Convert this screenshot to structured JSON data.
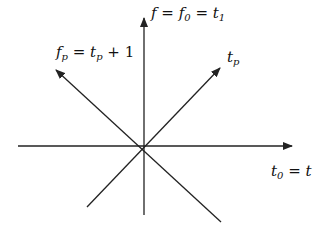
{
  "diagram": {
    "stroke_color": "#222222",
    "background": "#ffffff",
    "axes": [
      {
        "name": "horizontal-axis",
        "from": [
          18,
          146
        ],
        "to": [
          292,
          146
        ],
        "arrow": "end"
      },
      {
        "name": "vertical-axis",
        "from": [
          144,
          215
        ],
        "to": [
          144,
          18
        ],
        "arrow": "end"
      },
      {
        "name": "diagonal-tp",
        "from": [
          87,
          207
        ],
        "to": [
          220,
          68
        ],
        "arrow": "end"
      },
      {
        "name": "diagonal-fp",
        "from": [
          221,
          222
        ],
        "to": [
          56,
          70
        ],
        "arrow": "end"
      }
    ],
    "labels": {
      "vertical": {
        "f": "f",
        "eq1": "=",
        "f0_base": "f",
        "f0_sub": "0",
        "eq2": "=",
        "t1_base": "t",
        "t1_sub": "1"
      },
      "fp": {
        "f_base": "f",
        "f_sub": "p",
        "eq": "=",
        "t_base": "t",
        "t_sub": "p",
        "plus": "+",
        "one": "1"
      },
      "tp": {
        "base": "t",
        "sub": "p"
      },
      "horizontal": {
        "t0_base": "t",
        "t0_sub": "0",
        "eq": "=",
        "t": "t"
      }
    }
  }
}
